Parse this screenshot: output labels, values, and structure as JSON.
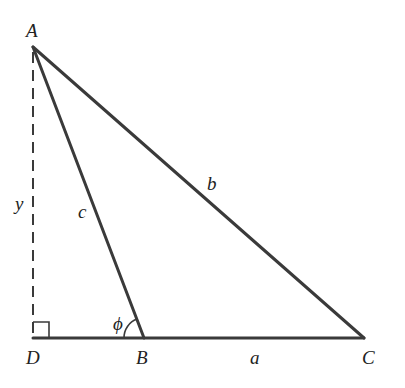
{
  "diagram": {
    "type": "triangle-geometry",
    "vertices": {
      "A": {
        "label": "A",
        "x": 33,
        "y": 47
      },
      "B": {
        "label": "B",
        "x": 144,
        "y": 338
      },
      "C": {
        "label": "C",
        "x": 364,
        "y": 338
      },
      "D": {
        "label": "D",
        "x": 33,
        "y": 338
      }
    },
    "sides": {
      "a": {
        "label": "a",
        "from": "B",
        "to": "C"
      },
      "b": {
        "label": "b",
        "from": "A",
        "to": "C"
      },
      "c": {
        "label": "c",
        "from": "A",
        "to": "B"
      },
      "y": {
        "label": "y",
        "from": "A",
        "to": "D",
        "style": "dashed"
      }
    },
    "angle": {
      "label": "ϕ",
      "at": "B"
    },
    "right_angle_at": "D",
    "colors": {
      "stroke": "#3a3a3a",
      "text": "#222222",
      "background": "#ffffff"
    }
  }
}
